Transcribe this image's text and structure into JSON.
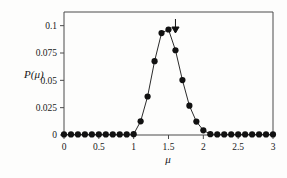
{
  "figure": {
    "background_color": "#fdfdfc",
    "frame_color": "#4a4a4a",
    "marker_color": "#111111",
    "line_color": "#2b2b2b"
  },
  "annotations": {
    "arrow": {
      "name": "down-arrow-marker",
      "glyph": "arrow-down-icon",
      "x_value": 1.6,
      "label": ""
    }
  },
  "chart_data": {
    "type": "line",
    "title": "",
    "subtitle": "",
    "xlabel": "μ",
    "ylabel": "P(μ)",
    "xlim": [
      0,
      3
    ],
    "ylim": [
      0,
      0.1125
    ],
    "grid": false,
    "legend": null,
    "markers": "filled-circle",
    "xticks": [
      0,
      0.5,
      1,
      1.5,
      2,
      2.5,
      3
    ],
    "xticklabels": [
      "0",
      "0.5",
      "1",
      "1.5",
      "2",
      "2.5",
      "3"
    ],
    "yticks": [
      0,
      0.025,
      0.05,
      0.075,
      0.1
    ],
    "yticklabels": [
      "0",
      "0.025",
      "0.05",
      "0.075",
      "0.1"
    ],
    "x": [
      0,
      0.1,
      0.2,
      0.3,
      0.4,
      0.5,
      0.6,
      0.7,
      0.8,
      0.9,
      1.0,
      1.1,
      1.2,
      1.3,
      1.4,
      1.5,
      1.6,
      1.7,
      1.8,
      1.9,
      2.0,
      2.1,
      2.2,
      2.3,
      2.4,
      2.5,
      2.6,
      2.7,
      2.8,
      2.9,
      3.0
    ],
    "y": [
      0.0005,
      0.0005,
      0.0005,
      0.0005,
      0.0005,
      0.0005,
      0.0005,
      0.0005,
      0.0005,
      0.0005,
      0.0008,
      0.0125,
      0.0352,
      0.0675,
      0.0932,
      0.0965,
      0.0775,
      0.0502,
      0.0268,
      0.0123,
      0.0043,
      0.0008,
      0.0005,
      0.0005,
      0.0005,
      0.0005,
      0.0005,
      0.0005,
      0.0005,
      0.0005,
      0.0005
    ],
    "series": [
      {
        "name": "P(μ)",
        "values": [
          0.0005,
          0.0005,
          0.0005,
          0.0005,
          0.0005,
          0.0005,
          0.0005,
          0.0005,
          0.0005,
          0.0005,
          0.0008,
          0.0125,
          0.0352,
          0.0675,
          0.0932,
          0.0965,
          0.0775,
          0.0502,
          0.0268,
          0.0123,
          0.0043,
          0.0008,
          0.0005,
          0.0005,
          0.0005,
          0.0005,
          0.0005,
          0.0005,
          0.0005,
          0.0005,
          0.0005
        ]
      }
    ],
    "annotations": [
      {
        "type": "arrow",
        "direction": "down",
        "x": 1.6,
        "text": ""
      }
    ]
  }
}
